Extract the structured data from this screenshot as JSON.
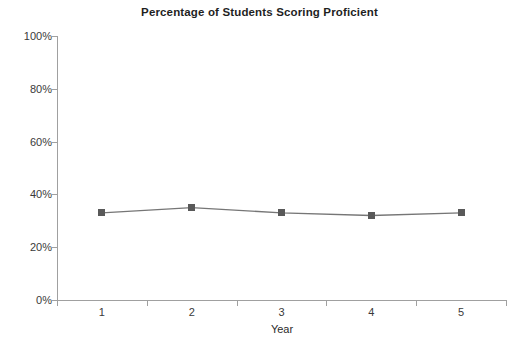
{
  "chart_data": {
    "type": "line",
    "title": "Percentage of Students Scoring Proficient",
    "xlabel": "Year",
    "ylabel": "",
    "categories": [
      "1",
      "2",
      "3",
      "4",
      "5"
    ],
    "values": [
      33,
      35,
      33,
      32,
      33
    ],
    "ylim": [
      0,
      100
    ],
    "ytick_labels": [
      "0%",
      "20%",
      "40%",
      "60%",
      "80%",
      "100%"
    ],
    "ytick_values": [
      0,
      20,
      40,
      60,
      80,
      100
    ],
    "grid": false,
    "legend": "none",
    "series": [
      {
        "name": "Percentage Proficient",
        "values": [
          33,
          35,
          33,
          32,
          33
        ],
        "marker": "square",
        "marker_color": "#595959",
        "line_color": "#767676"
      }
    ]
  },
  "colors": {
    "axis": "#a0a0a0",
    "text": "#3a3a3a",
    "title": "#1f1f1f",
    "marker": "#595959",
    "line": "#767676",
    "background": "#ffffff"
  }
}
